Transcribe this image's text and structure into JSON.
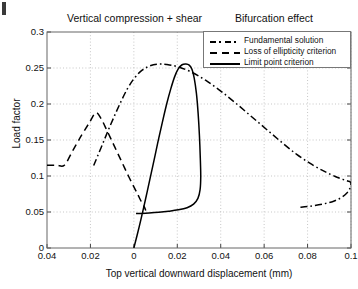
{
  "titles": {
    "left": "Vertical compression + shear",
    "right": "Bifurcation effect"
  },
  "axes": {
    "ylabel": "Load factor",
    "xlabel": "Top vertical downward displacement (mm)"
  },
  "legend": {
    "items": [
      {
        "label": "Fundamental solution",
        "style": "dash-dot"
      },
      {
        "label": "Loss of ellipticity criterion",
        "style": "dashed"
      },
      {
        "label": "Limit point criterion",
        "style": "solid"
      }
    ]
  },
  "colors": {
    "curve": "#000000",
    "grid": "#b9b9b9",
    "axis": "#555555",
    "background": "#ffffff"
  },
  "chart_data": {
    "type": "line",
    "title": "Vertical compression + shear   Bifurcation effect",
    "xlabel": "Top vertical downward displacement (mm)",
    "ylabel": "Load factor",
    "xlim": [
      -0.04,
      0.1
    ],
    "ylim": [
      0,
      0.3
    ],
    "xticks": [
      -0.04,
      -0.02,
      0,
      0.02,
      0.04,
      0.06,
      0.08,
      0.1
    ],
    "xticklabels": [
      "0.04",
      "0.02",
      "0",
      "0.02",
      "0.04",
      "0.06",
      "0.08",
      "0.1"
    ],
    "yticks": [
      0,
      0.05,
      0.1,
      0.15,
      0.2,
      0.25,
      0.3
    ],
    "yticklabels": [
      "0",
      "0.05",
      "0.1",
      "0.15",
      "0.2",
      "0.25",
      "0.3"
    ],
    "grid": true,
    "legend_position": "upper right",
    "series": [
      {
        "name": "Fundamental solution",
        "style": "dash-dot",
        "points": [
          [
            -0.0185,
            0.1145
          ],
          [
            -0.015,
            0.14
          ],
          [
            -0.012,
            0.162
          ],
          [
            -0.009,
            0.183
          ],
          [
            -0.006,
            0.203
          ],
          [
            -0.003,
            0.221
          ],
          [
            0.0,
            0.235
          ],
          [
            0.003,
            0.245
          ],
          [
            0.006,
            0.251
          ],
          [
            0.009,
            0.2545
          ],
          [
            0.012,
            0.2555
          ],
          [
            0.015,
            0.255
          ],
          [
            0.02,
            0.252
          ],
          [
            0.026,
            0.245
          ],
          [
            0.033,
            0.233
          ],
          [
            0.04,
            0.218
          ],
          [
            0.047,
            0.201
          ],
          [
            0.054,
            0.183
          ],
          [
            0.061,
            0.165
          ],
          [
            0.068,
            0.147
          ],
          [
            0.075,
            0.13
          ],
          [
            0.082,
            0.116
          ],
          [
            0.088,
            0.106
          ],
          [
            0.093,
            0.099
          ],
          [
            0.0965,
            0.095
          ],
          [
            0.0985,
            0.093
          ],
          [
            0.0995,
            0.092
          ],
          [
            0.1,
            0.09
          ],
          [
            0.0995,
            0.083
          ],
          [
            0.098,
            0.076
          ],
          [
            0.0955,
            0.07
          ],
          [
            0.092,
            0.065
          ],
          [
            0.087,
            0.061
          ],
          [
            0.081,
            0.058
          ],
          [
            0.076,
            0.0565
          ]
        ]
      },
      {
        "name": "Loss of ellipticity criterion",
        "style": "dashed",
        "points": [
          [
            -0.04,
            0.115
          ],
          [
            -0.0355,
            0.115
          ],
          [
            -0.032,
            0.115
          ],
          [
            -0.028,
            0.136
          ],
          [
            -0.024,
            0.157
          ],
          [
            -0.0205,
            0.174
          ],
          [
            -0.0175,
            0.188
          ],
          [
            -0.015,
            0.179
          ],
          [
            -0.0125,
            0.164
          ],
          [
            -0.01,
            0.148
          ],
          [
            -0.0075,
            0.132
          ],
          [
            -0.005,
            0.116
          ],
          [
            -0.0025,
            0.1
          ],
          [
            0.0,
            0.085
          ],
          [
            0.002,
            0.073
          ],
          [
            0.0035,
            0.064
          ],
          [
            0.0048,
            0.057
          ],
          [
            0.0055,
            0.052
          ]
        ]
      },
      {
        "name": "Limit point criterion",
        "style": "solid",
        "points": [
          [
            0.0,
            0.0
          ],
          [
            0.0025,
            0.03
          ],
          [
            0.0045,
            0.056
          ],
          [
            0.0062,
            0.079
          ],
          [
            0.008,
            0.104
          ],
          [
            0.0098,
            0.129
          ],
          [
            0.0115,
            0.153
          ],
          [
            0.0133,
            0.177
          ],
          [
            0.0152,
            0.201
          ],
          [
            0.017,
            0.221
          ],
          [
            0.0188,
            0.238
          ],
          [
            0.0205,
            0.249
          ],
          [
            0.0222,
            0.2545
          ],
          [
            0.024,
            0.2555
          ],
          [
            0.0255,
            0.254
          ],
          [
            0.0268,
            0.248
          ],
          [
            0.0278,
            0.236
          ],
          [
            0.0288,
            0.215
          ],
          [
            0.0296,
            0.187
          ],
          [
            0.0302,
            0.156
          ],
          [
            0.0306,
            0.125
          ],
          [
            0.0308,
            0.099
          ],
          [
            0.0305,
            0.081
          ],
          [
            0.0295,
            0.069
          ],
          [
            0.0275,
            0.061
          ],
          [
            0.0245,
            0.056
          ],
          [
            0.0205,
            0.053
          ],
          [
            0.016,
            0.051
          ],
          [
            0.0115,
            0.0495
          ],
          [
            0.007,
            0.0485
          ],
          [
            0.0035,
            0.048
          ],
          [
            0.001,
            0.0478
          ]
        ]
      }
    ]
  }
}
